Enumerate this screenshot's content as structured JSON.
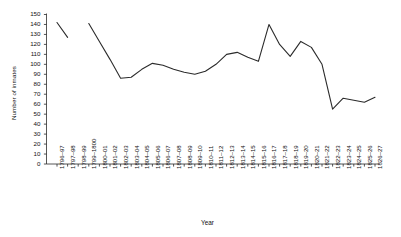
{
  "chart_data": {
    "type": "line",
    "title": "",
    "xlabel": "Year",
    "ylabel": "Number of inmates",
    "ylim": [
      0,
      150
    ],
    "ytick_step": 10,
    "yticks": [
      0,
      10,
      20,
      30,
      40,
      50,
      60,
      70,
      80,
      90,
      100,
      110,
      120,
      130,
      140,
      150
    ],
    "grid": false,
    "legend": null,
    "line_color": "#2b2b2b",
    "axis_color": "#2b2b2b",
    "categories": [
      "1796–97",
      "1797–98",
      "1798–99",
      "1799–1800",
      "1800–01",
      "1801–02",
      "1802–03",
      "1803–04",
      "1804–05",
      "1805–06",
      "1806–07",
      "1807–08",
      "1808–09",
      "1809–10",
      "1810–11",
      "1811–12",
      "1812–13",
      "1813–14",
      "1814–15",
      "1815–16",
      "1816–17",
      "1817–18",
      "1818–19",
      "1819–20",
      "1820–21",
      "1821–22",
      "1822–23",
      "1823–24",
      "1824–25",
      "1825–26",
      "1826–27"
    ],
    "values": [
      142,
      127,
      null,
      141,
      123,
      105,
      86,
      87,
      95,
      101,
      99,
      95,
      92,
      90,
      93,
      100,
      110,
      112,
      107,
      103,
      140,
      120,
      108,
      123,
      117,
      100,
      55,
      66,
      64,
      62,
      67
    ]
  }
}
